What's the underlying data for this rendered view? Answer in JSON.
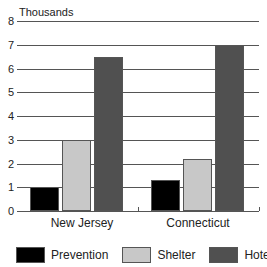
{
  "chart_data": {
    "type": "bar",
    "title": "",
    "ylabel": "Thousands",
    "xlabel": "",
    "ylim": [
      0,
      8
    ],
    "yticks": [
      0,
      1,
      2,
      3,
      4,
      5,
      6,
      7,
      8
    ],
    "grid": true,
    "legend_position": "bottom",
    "categories": [
      "New Jersey",
      "Connecticut"
    ],
    "series": [
      {
        "name": "Prevention",
        "color": "#000000",
        "values": [
          1.0,
          1.3
        ]
      },
      {
        "name": "Shelter",
        "color": "#c8c8c8",
        "values": [
          3.0,
          2.2
        ]
      },
      {
        "name": "Hotel/Motel",
        "color": "#505050",
        "values": [
          6.5,
          7.0
        ]
      }
    ]
  }
}
